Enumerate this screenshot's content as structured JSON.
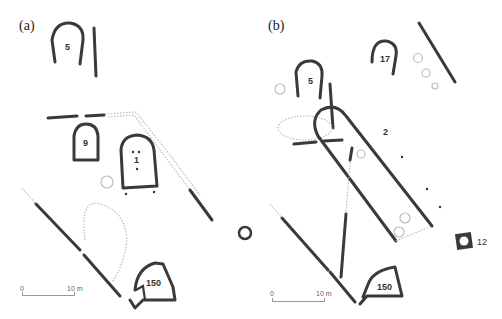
{
  "panels": [
    {
      "id": "a",
      "label": "(a)",
      "structures": [
        "5",
        "9",
        "1",
        "150"
      ],
      "scale": {
        "start": "0",
        "end": "10 m"
      }
    },
    {
      "id": "b",
      "label": "(b)",
      "structures": [
        "5",
        "17",
        "2",
        "12",
        "150"
      ],
      "scale": {
        "start": "0",
        "end": "10 m"
      }
    }
  ],
  "colors": {
    "wall": "#3a3a3a",
    "dotted": "#bcbcbc",
    "background": "#ffffff"
  }
}
